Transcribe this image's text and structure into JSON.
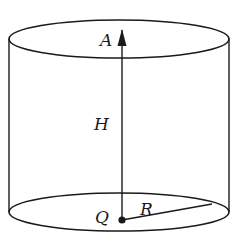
{
  "diagram": {
    "type": "cylinder",
    "labels": {
      "top_point": "A",
      "height": "H",
      "center_point": "Q",
      "radius": "R"
    },
    "colors": {
      "line": "#1a1a1a",
      "background": "#ffffff"
    }
  }
}
